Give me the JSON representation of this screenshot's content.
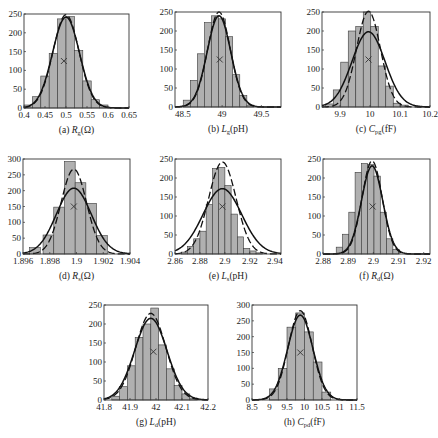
{
  "chart_data": [
    {
      "id": "a",
      "type": "bar",
      "caption_prefix": "(a)",
      "caption_symbol": "R",
      "caption_sub": "g",
      "caption_unit": "(Ω)",
      "xlim": [
        0.4,
        0.65
      ],
      "ylim": [
        0,
        250
      ],
      "xticks": [
        "0.4",
        "0.45",
        "0.5",
        "0.55",
        "0.6",
        "0.65"
      ],
      "xtick_values": [
        0.4,
        0.45,
        0.5,
        0.55,
        0.6,
        0.65
      ],
      "yticks": [
        "0",
        "50",
        "100",
        "150",
        "200",
        "250"
      ],
      "ytick_values": [
        0,
        50,
        100,
        150,
        200,
        250
      ],
      "bins": [
        0.41,
        0.43,
        0.45,
        0.47,
        0.49,
        0.51,
        0.53,
        0.55,
        0.57,
        0.59
      ],
      "bin_width": 0.02,
      "values": [
        8,
        30,
        85,
        145,
        237,
        243,
        153,
        72,
        22,
        8
      ],
      "fit_solid": {
        "mean": 0.5,
        "peak": 242,
        "sigma": 0.032
      },
      "fit_dashed": {
        "mean": 0.5,
        "peak": 248,
        "sigma": 0.031
      },
      "marker": {
        "x": 0.495,
        "y": 125
      }
    },
    {
      "id": "b",
      "type": "bar",
      "caption_prefix": "(b)",
      "caption_symbol": "L",
      "caption_sub": "g",
      "caption_unit": "(pH)",
      "xlim": [
        48.4,
        49.75
      ],
      "ylim": [
        0,
        250
      ],
      "xticks": [
        "48.5",
        "49",
        "49.5"
      ],
      "xtick_values": [
        48.5,
        49,
        49.5
      ],
      "yticks": [
        "0",
        "50",
        "100",
        "150",
        "200",
        "250"
      ],
      "ytick_values": [
        0,
        50,
        100,
        150,
        200,
        250
      ],
      "bins": [
        48.55,
        48.64,
        48.73,
        48.82,
        48.91,
        49.0,
        49.09,
        49.18,
        49.27,
        49.36
      ],
      "bin_width": 0.09,
      "values": [
        18,
        70,
        140,
        222,
        240,
        232,
        185,
        85,
        30,
        5
      ],
      "fit_solid": {
        "mean": 48.96,
        "peak": 240,
        "sigma": 0.15
      },
      "fit_dashed": {
        "mean": 48.96,
        "peak": 250,
        "sigma": 0.145
      },
      "marker": {
        "x": 48.97,
        "y": 125
      }
    },
    {
      "id": "c",
      "type": "bar",
      "caption_prefix": "(c)",
      "caption_symbol": "C",
      "caption_sub": "pg",
      "caption_unit": "(fF)",
      "xlim": [
        9.84,
        10.2
      ],
      "ylim": [
        0,
        250
      ],
      "xticks": [
        "9.9",
        "10",
        "10.1",
        "10.2"
      ],
      "xtick_values": [
        9.9,
        10,
        10.1,
        10.2
      ],
      "yticks": [
        "0",
        "50",
        "100",
        "150",
        "200",
        "250"
      ],
      "ytick_values": [
        0,
        50,
        100,
        150,
        200,
        250
      ],
      "bins": [
        9.865,
        9.89,
        9.915,
        9.94,
        9.965,
        9.99,
        10.015,
        10.04,
        10.065,
        10.09,
        10.115
      ],
      "bin_width": 0.025,
      "values": [
        8,
        45,
        118,
        200,
        212,
        250,
        212,
        108,
        55,
        10,
        5
      ],
      "fit_solid": {
        "mean": 9.995,
        "peak": 198,
        "sigma": 0.055
      },
      "fit_dashed": {
        "mean": 9.995,
        "peak": 252,
        "sigma": 0.04
      },
      "marker": {
        "x": 9.995,
        "y": 125
      }
    },
    {
      "id": "d",
      "type": "bar",
      "caption_prefix": "(d)",
      "caption_symbol": "R",
      "caption_sub": "s",
      "caption_unit": "(Ω)",
      "xlim": [
        1.896,
        1.904
      ],
      "ylim": [
        0,
        300
      ],
      "xticks": [
        "1.896",
        "1.898",
        "1.9",
        "1.902",
        "1.904"
      ],
      "xtick_values": [
        1.896,
        1.898,
        1.9,
        1.902,
        1.904
      ],
      "yticks": [
        "0",
        "50",
        "100",
        "150",
        "200",
        "250",
        "300"
      ],
      "ytick_values": [
        0,
        50,
        100,
        150,
        200,
        250,
        300
      ],
      "bins": [
        1.8969,
        1.8979,
        1.8987,
        1.8995,
        1.9003,
        1.9011,
        1.9019
      ],
      "bin_width": 0.0008,
      "values": [
        20,
        60,
        148,
        292,
        225,
        160,
        58
      ],
      "fit_solid": {
        "mean": 1.8998,
        "peak": 208,
        "sigma": 0.0013
      },
      "fit_dashed": {
        "mean": 1.8998,
        "peak": 268,
        "sigma": 0.00095
      },
      "marker": {
        "x": 1.8998,
        "y": 150
      }
    },
    {
      "id": "e",
      "type": "bar",
      "caption_prefix": "(e)",
      "caption_symbol": "L",
      "caption_sub": "s",
      "caption_unit": "(pH)",
      "xlim": [
        2.86,
        2.945
      ],
      "ylim": [
        0,
        250
      ],
      "xticks": [
        "2.86",
        "2.88",
        "2.9",
        "2.92",
        "2.94"
      ],
      "xtick_values": [
        2.86,
        2.88,
        2.9,
        2.92,
        2.94
      ],
      "yticks": [
        "0",
        "50",
        "100",
        "150",
        "200",
        "250"
      ],
      "ytick_values": [
        0,
        50,
        100,
        150,
        200,
        250
      ],
      "bins": [
        2.8675,
        2.8725,
        2.8775,
        2.8825,
        2.8875,
        2.8925,
        2.8975,
        2.9025,
        2.9075,
        2.9125,
        2.9175,
        2.9225,
        2.9275
      ],
      "bin_width": 0.005,
      "values": [
        5,
        20,
        40,
        60,
        130,
        225,
        228,
        180,
        105,
        45,
        15,
        8,
        3
      ],
      "fit_solid": {
        "mean": 2.898,
        "peak": 172,
        "sigma": 0.0155
      },
      "fit_dashed": {
        "mean": 2.898,
        "peak": 242,
        "sigma": 0.011
      },
      "marker": {
        "x": 2.898,
        "y": 125
      }
    },
    {
      "id": "f",
      "type": "bar",
      "caption_prefix": "(f)",
      "caption_symbol": "R",
      "caption_sub": "d",
      "caption_unit": "(Ω)",
      "xlim": [
        2.88,
        2.9225
      ],
      "ylim": [
        0,
        250
      ],
      "xticks": [
        "2.88",
        "2.89",
        "2.9",
        "2.91",
        "2.92"
      ],
      "xtick_values": [
        2.88,
        2.89,
        2.9,
        2.91,
        2.92
      ],
      "yticks": [
        "0",
        "50",
        "100",
        "150",
        "200",
        "250"
      ],
      "ytick_values": [
        0,
        50,
        100,
        150,
        200,
        250
      ],
      "bins": [
        2.8865,
        2.889,
        2.8915,
        2.894,
        2.8965,
        2.899,
        2.9015,
        2.904,
        2.9065,
        2.909
      ],
      "bin_width": 0.0025,
      "values": [
        18,
        52,
        110,
        215,
        238,
        235,
        205,
        110,
        40,
        12
      ],
      "fit_solid": {
        "mean": 2.8995,
        "peak": 232,
        "sigma": 0.0042
      },
      "fit_dashed": {
        "mean": 2.8995,
        "peak": 245,
        "sigma": 0.004
      },
      "marker": {
        "x": 2.8997,
        "y": 125
      }
    },
    {
      "id": "g",
      "type": "bar",
      "caption_prefix": "(g)",
      "caption_symbol": "L",
      "caption_sub": "d",
      "caption_unit": "(pH)",
      "xlim": [
        41.8,
        42.2
      ],
      "ylim": [
        0,
        250
      ],
      "xticks": [
        "41.8",
        "41.9",
        "42",
        "42.1",
        "42.2"
      ],
      "xtick_values": [
        41.8,
        41.9,
        42,
        42.1,
        42.2
      ],
      "yticks": [
        "0",
        "50",
        "100",
        "150",
        "200",
        "250"
      ],
      "ytick_values": [
        0,
        50,
        100,
        150,
        200,
        250
      ],
      "bins": [
        41.845,
        41.875,
        41.905,
        41.935,
        41.965,
        41.995,
        42.025,
        42.055,
        42.085,
        42.115,
        42.145
      ],
      "bin_width": 0.03,
      "values": [
        10,
        35,
        90,
        165,
        200,
        242,
        145,
        82,
        38,
        16,
        5
      ],
      "fit_solid": {
        "mean": 41.98,
        "peak": 215,
        "sigma": 0.062
      },
      "fit_dashed": {
        "mean": 41.98,
        "peak": 228,
        "sigma": 0.058
      },
      "marker": {
        "x": 41.99,
        "y": 127
      }
    },
    {
      "id": "h",
      "type": "bar",
      "caption_prefix": "(h)",
      "caption_symbol": "C",
      "caption_sub": "pd",
      "caption_unit": "(fF)",
      "xlim": [
        8.5,
        11.5
      ],
      "ylim": [
        0,
        300
      ],
      "xticks": [
        "8.5",
        "9",
        "9.5",
        "10",
        "10.5",
        "11",
        "11.5"
      ],
      "xtick_values": [
        8.5,
        9,
        9.5,
        10,
        10.5,
        11,
        11.5
      ],
      "yticks": [
        "0",
        "50",
        "100",
        "150",
        "200",
        "250",
        "300"
      ],
      "ytick_values": [
        0,
        50,
        100,
        150,
        200,
        250,
        300
      ],
      "bins": [
        9.125,
        9.375,
        9.625,
        9.875,
        10.125,
        10.375,
        10.625
      ],
      "bin_width": 0.25,
      "values": [
        35,
        100,
        230,
        275,
        215,
        120,
        25
      ],
      "fit_solid": {
        "mean": 9.88,
        "peak": 268,
        "sigma": 0.36
      },
      "fit_dashed": {
        "mean": 9.88,
        "peak": 282,
        "sigma": 0.34
      },
      "marker": {
        "x": 9.88,
        "y": 150
      }
    }
  ]
}
